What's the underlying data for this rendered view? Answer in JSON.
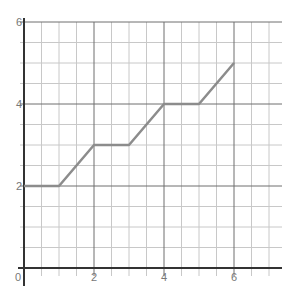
{
  "chart_data": {
    "type": "line",
    "title": "",
    "xlabel": "",
    "ylabel": "",
    "xlim": [
      0,
      7.5
    ],
    "ylim": [
      0,
      6
    ],
    "grid": true,
    "minor_step": 0.5,
    "major_step": 2,
    "x_ticks": [
      0,
      2,
      4,
      6
    ],
    "y_ticks": [
      2,
      4,
      6
    ],
    "series": [
      {
        "name": "line",
        "color": "#8c8c8c",
        "x": [
          0,
          1,
          2,
          3,
          4,
          5,
          6
        ],
        "y": [
          2,
          2,
          3,
          3,
          4,
          4,
          5
        ]
      }
    ]
  },
  "colors": {
    "minor_grid": "#c8c8c8",
    "major_grid": "#6e6e6e",
    "axis": "#333333",
    "tick_label": "#777777"
  },
  "layout": {
    "x0_px": 24,
    "x_unit_px": 35,
    "y0_px": 268,
    "y_unit_px": 41,
    "right_px": 282
  }
}
